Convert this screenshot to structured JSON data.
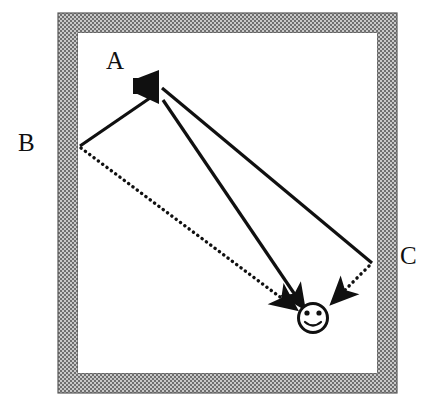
{
  "figure": {
    "background_color": "#ffffff",
    "wall_fill_color": "#8c8c8c",
    "wall_pattern": "hatched-gray",
    "line_color": "#101010",
    "room": {
      "outer": {
        "x": 58,
        "y": 13,
        "width": 339,
        "height": 380
      },
      "wall_thickness": 20,
      "inner": {
        "x": 78,
        "y": 33,
        "width": 299,
        "height": 340
      }
    },
    "source": {
      "name": "loudspeaker",
      "icon": "speaker-icon",
      "facing": "left",
      "x": 148,
      "y": 87
    },
    "receiver": {
      "name": "listener",
      "icon": "smiley-face-icon",
      "x": 313,
      "y": 318,
      "radius": 15
    },
    "labels": [
      {
        "id": "A",
        "text": "A",
        "role": "direct-path-label"
      },
      {
        "id": "B",
        "text": "B",
        "role": "left-reflection-label"
      },
      {
        "id": "C",
        "text": "C",
        "role": "right-reflection-label"
      }
    ],
    "paths": [
      {
        "id": "A",
        "name": "direct-sound-path",
        "style": "solid",
        "arrow": "at-receiver",
        "points": [
          [
            163,
            100
          ],
          [
            303,
            307
          ]
        ]
      },
      {
        "id": "B",
        "name": "left-wall-reflection-path",
        "incident_style": "solid",
        "reflected_style": "dotted",
        "reflection_point": [
          80,
          146
        ],
        "points": [
          [
            150,
            98
          ],
          [
            80,
            146
          ],
          [
            298,
            310
          ]
        ],
        "arrow": "at-receiver"
      },
      {
        "id": "C",
        "name": "right-wall-reflection-path",
        "incident_style": "solid",
        "reflected_style": "dotted",
        "reflection_point": [
          372,
          263
        ],
        "points": [
          [
            162,
            88
          ],
          [
            372,
            263
          ],
          [
            330,
            305
          ]
        ],
        "arrow": "at-receiver"
      }
    ]
  },
  "caption": {
    "cut_text": " "
  }
}
